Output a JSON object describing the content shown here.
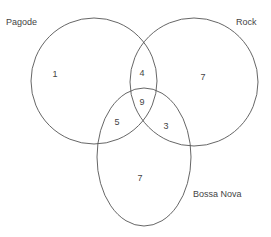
{
  "diagram": {
    "type": "venn",
    "sets": [
      {
        "id": "pagode",
        "label": "Pagode"
      },
      {
        "id": "rock",
        "label": "Rock"
      },
      {
        "id": "bossa_nova",
        "label": "Bossa Nova"
      }
    ],
    "regions": {
      "pagode_only": "1",
      "rock_only": "7",
      "bossa_nova_only": "7",
      "pagode_rock": "4",
      "pagode_bossa_nova": "5",
      "rock_bossa_nova": "3",
      "all_three": "9"
    }
  }
}
